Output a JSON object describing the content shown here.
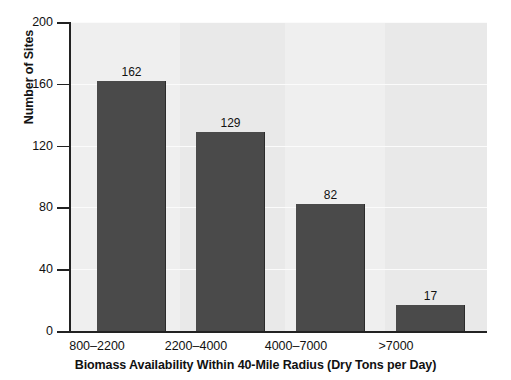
{
  "chart_data": {
    "type": "bar",
    "title": "",
    "categories": [
      "800–2200",
      "2200–4000",
      "4000–7000",
      ">7000"
    ],
    "values": [
      162,
      129,
      82,
      17
    ],
    "value_labels": [
      "162",
      "129",
      "82",
      "17"
    ],
    "xlabel": "Biomass Availability Within 40-Mile Radius (Dry Tons per Day)",
    "ylabel": "Number of Sites",
    "ylim": [
      0,
      200
    ],
    "yticks": [
      0,
      40,
      80,
      120,
      160,
      200
    ],
    "ytick_labels": [
      "0",
      "40",
      "80",
      "120",
      "160",
      "200"
    ],
    "grid": "horizontal",
    "legend": "none",
    "colors": {
      "bar": "#4a4a4a",
      "bar_edge": "#2b2b2b",
      "plot_background": "#eeeeee",
      "band_light": "#efefef",
      "band_dark": "#e9e9e9",
      "gridline": "#fbfbfb",
      "axis": "#222222",
      "text": "#111111",
      "page_background": "#ffffff"
    }
  }
}
